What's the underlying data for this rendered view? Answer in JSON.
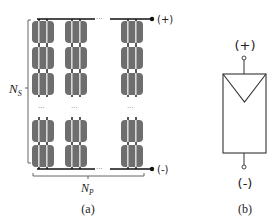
{
  "panel_a": {
    "caption": "(a)",
    "series_label": "N",
    "series_sub": "S",
    "parallel_label": "N",
    "parallel_sub": "P",
    "positive_terminal": "(+)",
    "negative_terminal": "(-)",
    "ellipsis": "···",
    "columns_shown": 3,
    "rows_shown_top": 3,
    "rows_shown_bottom": 2,
    "cell_color": "#6e6e6e",
    "stripe_color": "#d8d8d8",
    "wire_color": "#111111"
  },
  "panel_b": {
    "caption": "(b)",
    "positive_terminal": "(+)",
    "negative_terminal": "(-)",
    "symbol": "pv-array-symbol"
  }
}
